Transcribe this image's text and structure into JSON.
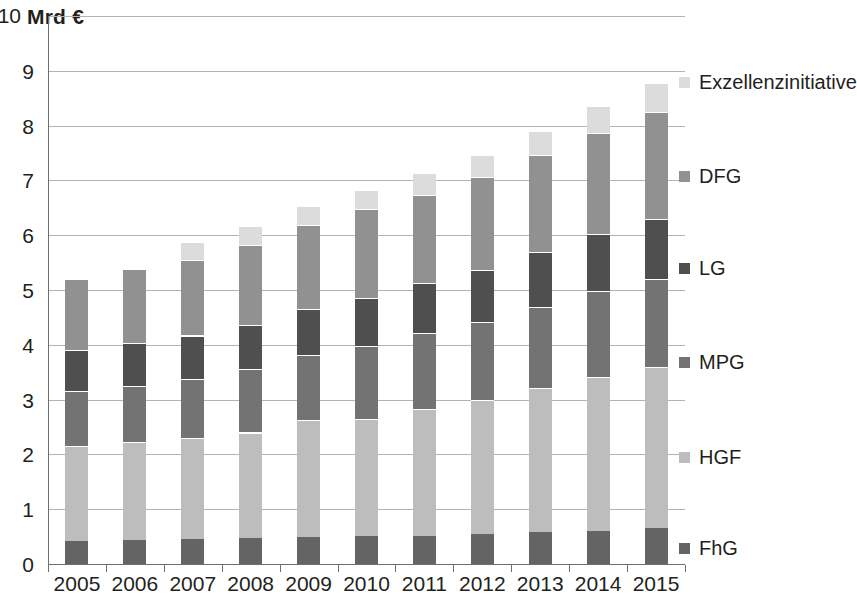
{
  "chart_data": {
    "type": "bar",
    "stacked": true,
    "title": "",
    "subtitle": "",
    "xlabel": "",
    "ylabel": "Mrd €",
    "unit_caption": "Mrd €",
    "categories": [
      "2005",
      "2006",
      "2007",
      "2008",
      "2009",
      "2010",
      "2011",
      "2012",
      "2013",
      "2014",
      "2015"
    ],
    "ylim": [
      0,
      10
    ],
    "yticks": [
      "0",
      "1",
      "2",
      "3",
      "4",
      "5",
      "6",
      "7",
      "8",
      "9",
      "10"
    ],
    "ytick_values": [
      0,
      1,
      2,
      3,
      4,
      5,
      6,
      7,
      8,
      9,
      10
    ],
    "grid": true,
    "grid_axis": "y",
    "legend_position": "right",
    "series": [
      {
        "name": "FhG",
        "color": "#646464",
        "values": [
          0.42,
          0.44,
          0.45,
          0.47,
          0.5,
          0.51,
          0.52,
          0.54,
          0.58,
          0.6,
          0.65
        ]
      },
      {
        "name": "HGF",
        "color": "#bdbdbd",
        "values": [
          1.73,
          1.79,
          1.85,
          1.93,
          2.12,
          2.14,
          2.3,
          2.46,
          2.63,
          2.82,
          2.95
        ]
      },
      {
        "name": "MPG",
        "color": "#737373",
        "values": [
          1.0,
          1.02,
          1.07,
          1.15,
          1.2,
          1.33,
          1.39,
          1.42,
          1.48,
          1.56,
          1.6
        ]
      },
      {
        "name": "LG",
        "color": "#4f4f4f",
        "values": [
          0.75,
          0.78,
          0.8,
          0.82,
          0.84,
          0.87,
          0.91,
          0.95,
          1.01,
          1.04,
          1.1
        ]
      },
      {
        "name": "DFG",
        "color": "#919191",
        "values": [
          1.3,
          1.35,
          1.38,
          1.45,
          1.52,
          1.63,
          1.62,
          1.7,
          1.77,
          1.84,
          1.95
        ]
      },
      {
        "name": "Exzellenzinitiative",
        "color": "#dcdcdc",
        "values": [
          0.0,
          0.0,
          0.33,
          0.34,
          0.35,
          0.35,
          0.4,
          0.4,
          0.44,
          0.5,
          0.53
        ]
      }
    ],
    "totals": [
      5.2,
      5.38,
      5.88,
      6.16,
      6.53,
      6.83,
      7.14,
      7.47,
      7.91,
      8.36,
      8.78
    ]
  },
  "legend": {
    "items": [
      {
        "label": "Exzellenzinitiative",
        "color": "#dcdcdc"
      },
      {
        "label": "DFG",
        "color": "#919191"
      },
      {
        "label": "LG",
        "color": "#4f4f4f"
      },
      {
        "label": "MPG",
        "color": "#737373"
      },
      {
        "label": "HGF",
        "color": "#bdbdbd"
      },
      {
        "label": "FhG",
        "color": "#646464"
      }
    ]
  },
  "axis": {
    "unit_caption": "Mrd €"
  }
}
